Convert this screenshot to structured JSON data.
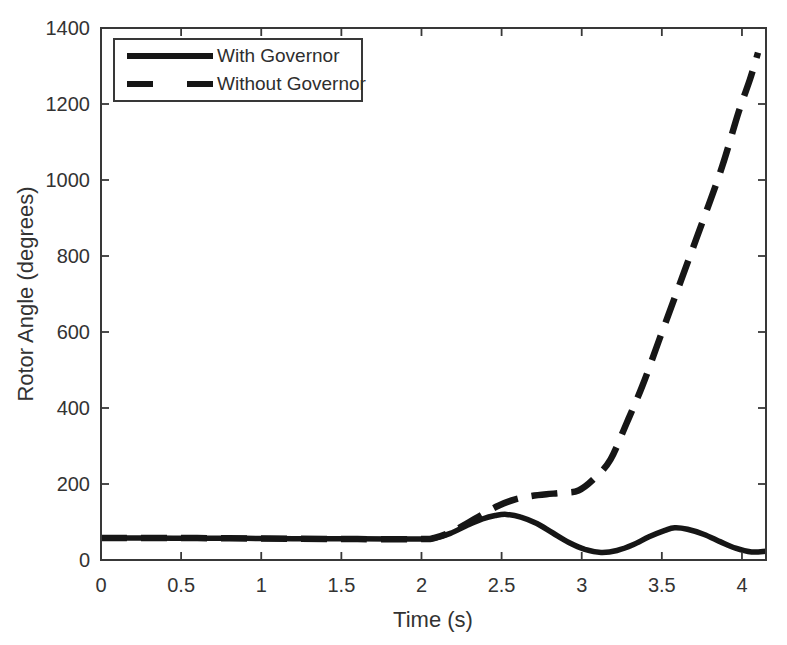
{
  "figure": {
    "background": "#ffffff",
    "ink_color": "#161616",
    "frame_color": "#383838",
    "text_color": "#333333"
  },
  "chart_data": {
    "type": "line",
    "xlabel": "Time (s)",
    "ylabel": "Rotor Angle (degrees)",
    "xlim": [
      0,
      4.15
    ],
    "ylim": [
      0,
      1400
    ],
    "xticks": [
      0,
      0.5,
      1,
      1.5,
      2,
      2.5,
      3,
      3.5,
      4
    ],
    "yticks": [
      0,
      200,
      400,
      600,
      800,
      1000,
      1200,
      1400
    ],
    "grid": false,
    "legend": {
      "position": "top-left",
      "entries": [
        "With Governor",
        "Without Governor"
      ]
    },
    "series": [
      {
        "name": "With Governor",
        "style": "solid",
        "color": "#161616",
        "width": 5.5,
        "points": [
          [
            0,
            58
          ],
          [
            0.3,
            58
          ],
          [
            0.6,
            57
          ],
          [
            0.9,
            57
          ],
          [
            1.2,
            56
          ],
          [
            1.5,
            56
          ],
          [
            1.8,
            55
          ],
          [
            2.0,
            55
          ],
          [
            2.08,
            57
          ],
          [
            2.18,
            70
          ],
          [
            2.28,
            90
          ],
          [
            2.38,
            108
          ],
          [
            2.46,
            117
          ],
          [
            2.53,
            120
          ],
          [
            2.62,
            113
          ],
          [
            2.72,
            96
          ],
          [
            2.82,
            71
          ],
          [
            2.92,
            46
          ],
          [
            3.02,
            28
          ],
          [
            3.12,
            20
          ],
          [
            3.22,
            25
          ],
          [
            3.32,
            40
          ],
          [
            3.42,
            61
          ],
          [
            3.52,
            78
          ],
          [
            3.58,
            85
          ],
          [
            3.66,
            81
          ],
          [
            3.76,
            68
          ],
          [
            3.86,
            49
          ],
          [
            3.96,
            31
          ],
          [
            4.06,
            21
          ],
          [
            4.15,
            23
          ]
        ]
      },
      {
        "name": "Without Governor",
        "style": "dashed",
        "color": "#161616",
        "width": 6.5,
        "dash": [
          26,
          14
        ],
        "points": [
          [
            0,
            58
          ],
          [
            0.4,
            58
          ],
          [
            0.8,
            57
          ],
          [
            1.2,
            56
          ],
          [
            1.6,
            55
          ],
          [
            2.0,
            55
          ],
          [
            2.08,
            58
          ],
          [
            2.18,
            73
          ],
          [
            2.28,
            95
          ],
          [
            2.38,
            120
          ],
          [
            2.48,
            143
          ],
          [
            2.58,
            159
          ],
          [
            2.68,
            168
          ],
          [
            2.78,
            173
          ],
          [
            2.88,
            177
          ],
          [
            2.98,
            183
          ],
          [
            3.08,
            215
          ],
          [
            3.18,
            265
          ],
          [
            3.28,
            360
          ],
          [
            3.38,
            460
          ],
          [
            3.48,
            575
          ],
          [
            3.58,
            690
          ],
          [
            3.68,
            805
          ],
          [
            3.78,
            920
          ],
          [
            3.88,
            1040
          ],
          [
            3.98,
            1180
          ],
          [
            4.05,
            1265
          ],
          [
            4.1,
            1335
          ]
        ]
      }
    ]
  }
}
